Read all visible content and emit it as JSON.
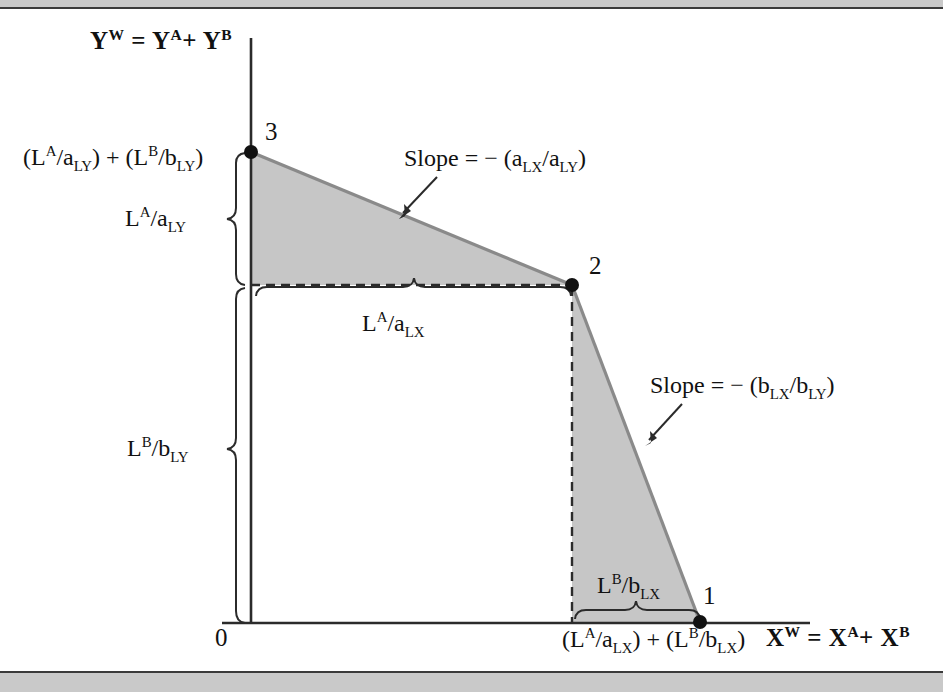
{
  "figure": {
    "kind": "economics-diagram",
    "colors": {
      "shade_fill": "#c6c6c6",
      "shade_stroke": "#8a8a8a",
      "axis": "#2b2b2b",
      "dashed": "#2b2b2b",
      "band": "#c9c9c9",
      "rule": "#3a3a3a"
    }
  },
  "axes": {
    "y_axis_title_html": "Y<sup>W</sup> = Y<sup>A</sup>+ Y<sup>B</sup>",
    "x_axis_title_html": "X<sup>W</sup> = X<sup>A</sup>+ X<sup>B</sup>",
    "origin_label": "0"
  },
  "ticks": {
    "y_intercept_html": "(L<sup>A</sup>/a<sub>LY</sub>) + (L<sup>B</sup>/b<sub>LY</sub>)",
    "x_intercept_html": "(L<sup>A</sup>/a<sub>LX</sub>) + (L<sup>B</sup>/b<sub>LX</sub>)"
  },
  "points": [
    {
      "name": "point-3",
      "label": "3",
      "role": "y-intercept",
      "x": 251,
      "y": 152
    },
    {
      "name": "point-2",
      "label": "2",
      "role": "kink",
      "x": 572,
      "y": 285
    },
    {
      "name": "point-1",
      "label": "1",
      "role": "x-intercept",
      "x": 700,
      "y": 622
    }
  ],
  "braces": [
    {
      "name": "brace-la-aly",
      "label_html": "L<sup>A</sup>/a<sub>LY</sub>",
      "orientation": "vertical",
      "spans": "from point 3 down to the kink level"
    },
    {
      "name": "brace-lb-bly",
      "label_html": "L<sup>B</sup>/b<sub>LY</sub>",
      "orientation": "vertical",
      "spans": "from the kink level down to the horizontal axis"
    },
    {
      "name": "brace-la-alx",
      "label_html": "L<sup>A</sup>/a<sub>LX</sub>",
      "orientation": "horizontal",
      "spans": "from the vertical axis across to point 2"
    },
    {
      "name": "brace-lb-blx",
      "label_html": "L<sup>B</sup>/b<sub>LX</sub>",
      "orientation": "horizontal",
      "spans": "from below point 2 across to point 1"
    }
  ],
  "annotations": [
    {
      "name": "slope-upper",
      "text_html": "Slope = &minus; (a<sub>LX</sub>/a<sub>LY</sub>)",
      "points_to": "upper frontier segment between point 3 and point 2"
    },
    {
      "name": "slope-lower",
      "text_html": "Slope = &minus; (b<sub>LX</sub>/b<sub>LY</sub>)",
      "points_to": "lower frontier segment between point 2 and point 1"
    }
  ],
  "chart_data": {
    "type": "line",
    "title": "",
    "xlabel": "X^W = X^A + X^B",
    "ylabel": "Y^W = Y^A + Y^B",
    "grid": false,
    "legend": "none",
    "xlim": [
      0,
      1
    ],
    "ylim": [
      0,
      1
    ],
    "annotations": [
      "Slope = - (a_LX/a_LY)",
      "Slope = - (b_LX/b_LY)"
    ],
    "series": [
      {
        "name": "world production possibility frontier",
        "symbolic_points": [
          {
            "label": "3",
            "x": "0",
            "y": "(L^A/a_LY) + (L^B/b_LY)"
          },
          {
            "label": "2",
            "x": "L^A/a_LX",
            "y": "L^B/b_LY"
          },
          {
            "label": "1",
            "x": "(L^A/a_LX) + (L^B/b_LX)",
            "y": "0"
          }
        ],
        "pixel_x": [
          251,
          572,
          700
        ],
        "pixel_y": [
          152,
          285,
          622
        ],
        "segment_slopes": [
          "-(a_LX/a_LY)",
          "-(b_LX/b_LY)"
        ]
      }
    ]
  }
}
